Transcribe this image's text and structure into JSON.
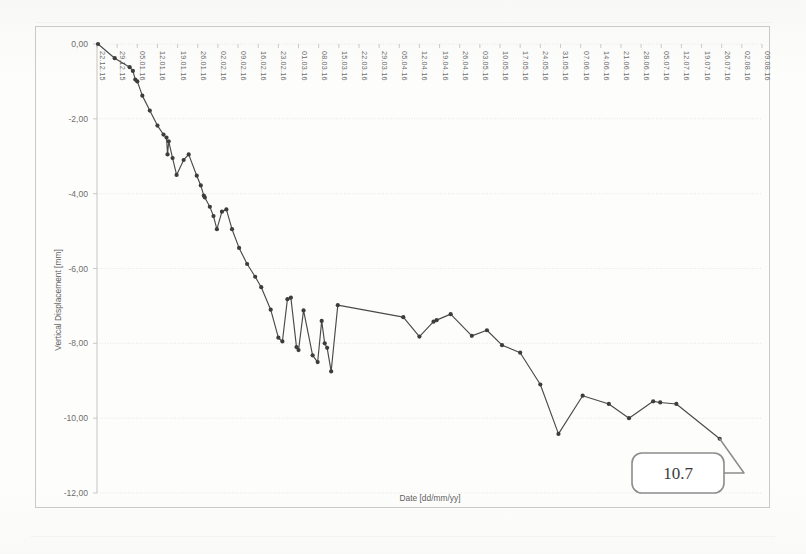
{
  "chart_data": {
    "type": "line",
    "title": "",
    "xlabel": "Date [dd/mm/yy]",
    "ylabel": "Vertical Displacement [mm]",
    "ylim": [
      -12,
      0
    ],
    "yticks": [
      0,
      -2,
      -4,
      -6,
      -8,
      -10,
      -12
    ],
    "ytick_labels": [
      "0,00",
      "-2,00",
      "-4,00",
      "-6,00",
      "-8,00",
      "-10,00",
      "-12,00"
    ],
    "grid": true,
    "legend": "none",
    "xtick_labels": [
      "22.12.15",
      "29.12.15",
      "05.01.16",
      "12.01.16",
      "19.01.16",
      "26.01.16",
      "02.02.16",
      "09.02.16",
      "16.02.16",
      "23.02.16",
      "01.03.16",
      "08.03.16",
      "15.03.16",
      "22.03.16",
      "29.03.16",
      "05.04.16",
      "12.04.16",
      "19.04.16",
      "26.04.16",
      "03.05.16",
      "10.05.16",
      "17.05.16",
      "24.05.16",
      "31.05.16",
      "07.06.16",
      "14.06.16",
      "21.06.16",
      "28.06.16",
      "05.07.16",
      "12.07.16",
      "19.07.16",
      "26.07.16",
      "02.08.16",
      "09.08.16"
    ],
    "x_axis_type": "date-weekly",
    "x_start": "22.12.15",
    "x_end": "09.08.16",
    "series": [
      {
        "name": "Vertical Displacement",
        "marker": "circle",
        "color": "#4a4a4a",
        "points": [
          {
            "x": 0.05,
            "y": 0.0
          },
          {
            "x": 0.88,
            "y": -0.38
          },
          {
            "x": 1.62,
            "y": -0.62
          },
          {
            "x": 1.78,
            "y": -0.72
          },
          {
            "x": 1.9,
            "y": -0.95
          },
          {
            "x": 2.0,
            "y": -1.0
          },
          {
            "x": 2.25,
            "y": -1.38
          },
          {
            "x": 2.62,
            "y": -1.78
          },
          {
            "x": 3.0,
            "y": -2.18
          },
          {
            "x": 3.3,
            "y": -2.42
          },
          {
            "x": 3.45,
            "y": -2.5
          },
          {
            "x": 3.5,
            "y": -2.95
          },
          {
            "x": 3.56,
            "y": -2.6
          },
          {
            "x": 3.75,
            "y": -3.05
          },
          {
            "x": 3.95,
            "y": -3.5
          },
          {
            "x": 4.3,
            "y": -3.1
          },
          {
            "x": 4.55,
            "y": -2.95
          },
          {
            "x": 4.95,
            "y": -3.52
          },
          {
            "x": 5.15,
            "y": -3.78
          },
          {
            "x": 5.3,
            "y": -4.05
          },
          {
            "x": 5.35,
            "y": -4.1
          },
          {
            "x": 5.6,
            "y": -4.35
          },
          {
            "x": 5.78,
            "y": -4.6
          },
          {
            "x": 5.95,
            "y": -4.95
          },
          {
            "x": 6.2,
            "y": -4.48
          },
          {
            "x": 6.42,
            "y": -4.42
          },
          {
            "x": 6.7,
            "y": -4.95
          },
          {
            "x": 7.05,
            "y": -5.45
          },
          {
            "x": 7.45,
            "y": -5.88
          },
          {
            "x": 7.85,
            "y": -6.22
          },
          {
            "x": 8.15,
            "y": -6.5
          },
          {
            "x": 8.62,
            "y": -7.1
          },
          {
            "x": 9.0,
            "y": -7.85
          },
          {
            "x": 9.2,
            "y": -7.95
          },
          {
            "x": 9.45,
            "y": -6.82
          },
          {
            "x": 9.62,
            "y": -6.78
          },
          {
            "x": 9.9,
            "y": -8.1
          },
          {
            "x": 10.0,
            "y": -8.18
          },
          {
            "x": 10.25,
            "y": -7.12
          },
          {
            "x": 10.7,
            "y": -8.32
          },
          {
            "x": 10.95,
            "y": -8.5
          },
          {
            "x": 11.15,
            "y": -7.4
          },
          {
            "x": 11.3,
            "y": -8.0
          },
          {
            "x": 11.42,
            "y": -8.12
          },
          {
            "x": 11.62,
            "y": -8.75
          },
          {
            "x": 11.95,
            "y": -6.98
          },
          {
            "x": 15.2,
            "y": -7.3
          },
          {
            "x": 16.0,
            "y": -7.82
          },
          {
            "x": 16.7,
            "y": -7.42
          },
          {
            "x": 16.85,
            "y": -7.38
          },
          {
            "x": 17.55,
            "y": -7.22
          },
          {
            "x": 18.6,
            "y": -7.8
          },
          {
            "x": 19.35,
            "y": -7.65
          },
          {
            "x": 20.1,
            "y": -8.05
          },
          {
            "x": 21.0,
            "y": -8.25
          },
          {
            "x": 22.0,
            "y": -9.1
          },
          {
            "x": 22.9,
            "y": -10.42
          },
          {
            "x": 24.1,
            "y": -9.4
          },
          {
            "x": 25.4,
            "y": -9.62
          },
          {
            "x": 26.4,
            "y": -10.0
          },
          {
            "x": 27.6,
            "y": -9.55
          },
          {
            "x": 27.95,
            "y": -9.58
          },
          {
            "x": 28.75,
            "y": -9.62
          },
          {
            "x": 30.9,
            "y": -10.55
          }
        ]
      }
    ],
    "annotations": [
      {
        "label": "10.7",
        "shape": "rounded-rect-callout",
        "points_to": "final-data-point"
      }
    ]
  }
}
